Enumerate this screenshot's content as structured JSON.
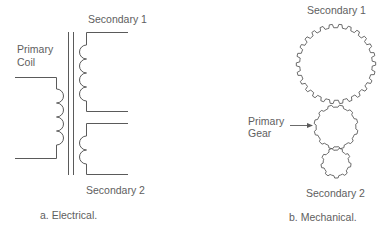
{
  "electrical": {
    "labels": {
      "secondary1": "Secondary 1",
      "primary_line1": "Primary",
      "primary_line2": "Coil",
      "secondary2": "Secondary 2"
    },
    "caption": "a.  Electrical.",
    "primary_turns": 4,
    "secondary1_turns": 4,
    "secondary2_turns": 2
  },
  "mechanical": {
    "labels": {
      "secondary1": "Secondary 1",
      "primary_line1": "Primary",
      "primary_line2": "Gear",
      "secondary2": "Secondary 2"
    },
    "caption": "b.  Mechanical.",
    "gears": [
      {
        "name": "secondary-1-gear",
        "cx": 336,
        "cy": 64,
        "r": 38,
        "teeth": 26
      },
      {
        "name": "primary-gear",
        "cx": 336,
        "cy": 127,
        "r": 21,
        "teeth": 12
      },
      {
        "name": "secondary-2-gear",
        "cx": 336,
        "cy": 163,
        "r": 14,
        "teeth": 9
      }
    ]
  },
  "colors": {
    "line": "#5a5a5a",
    "text": "#5e5e5e"
  }
}
